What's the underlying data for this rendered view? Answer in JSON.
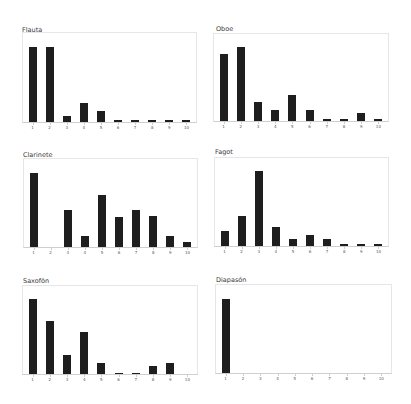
{
  "chart_data": [
    {
      "type": "bar",
      "title": "Flauta",
      "categories": [
        "1",
        "2",
        "3",
        "4",
        "5",
        "6",
        "7",
        "8",
        "9",
        "10"
      ],
      "values": [
        75,
        75,
        6,
        19,
        11,
        2,
        2,
        2,
        2,
        2
      ],
      "xlabel": "",
      "ylabel": "",
      "grid": false,
      "legend": "none",
      "layout": {
        "title_x": 22,
        "title_y": 26,
        "x": 22,
        "y": 32,
        "w": 175,
        "h": 91
      }
    },
    {
      "type": "bar",
      "title": "Oboe",
      "categories": [
        "1",
        "2",
        "3",
        "4",
        "5",
        "6",
        "7",
        "8",
        "9",
        "10"
      ],
      "values": [
        67,
        74,
        19,
        11,
        26,
        11,
        2,
        2,
        8,
        2
      ],
      "xlabel": "",
      "ylabel": "",
      "grid": false,
      "legend": "none",
      "layout": {
        "title_x": 216,
        "title_y": 25,
        "x": 213,
        "y": 33,
        "w": 176,
        "h": 89
      }
    },
    {
      "type": "bar",
      "title": "Clarinete",
      "categories": [
        "1",
        "2",
        "3",
        "4",
        "5",
        "6",
        "7",
        "8",
        "9",
        "10"
      ],
      "values": [
        74,
        0,
        37,
        11,
        52,
        30,
        37,
        31,
        11,
        5
      ],
      "xlabel": "",
      "ylabel": "",
      "grid": false,
      "legend": "none",
      "layout": {
        "title_x": 23,
        "title_y": 151,
        "x": 23,
        "y": 158,
        "w": 175,
        "h": 90
      }
    },
    {
      "type": "bar",
      "title": "Fagot",
      "categories": [
        "1",
        "2",
        "3",
        "4",
        "5",
        "6",
        "7",
        "8",
        "9",
        "10"
      ],
      "values": [
        15,
        30,
        75,
        19,
        7,
        11,
        7,
        2,
        2,
        2
      ],
      "xlabel": "",
      "ylabel": "",
      "grid": false,
      "legend": "none",
      "layout": {
        "title_x": 215,
        "title_y": 148,
        "x": 214,
        "y": 157,
        "w": 175,
        "h": 90
      }
    },
    {
      "type": "bar",
      "title": "Saxofón",
      "categories": [
        "1",
        "2",
        "3",
        "4",
        "5",
        "6",
        "7",
        "8",
        "9",
        "10"
      ],
      "values": [
        75,
        53,
        19,
        42,
        11,
        1,
        1,
        8,
        11,
        0
      ],
      "xlabel": "",
      "ylabel": "",
      "grid": false,
      "legend": "none",
      "layout": {
        "title_x": 23,
        "title_y": 277,
        "x": 22,
        "y": 285,
        "w": 176,
        "h": 90
      }
    },
    {
      "type": "bar",
      "title": "Diapasón",
      "categories": [
        "1",
        "2",
        "3",
        "4",
        "5",
        "6",
        "7",
        "8",
        "9",
        "10"
      ],
      "values": [
        74,
        0,
        0,
        0,
        0,
        0,
        0,
        0,
        0,
        0
      ],
      "xlabel": "",
      "ylabel": "",
      "grid": false,
      "legend": "none",
      "layout": {
        "title_x": 216,
        "title_y": 276,
        "x": 215,
        "y": 284,
        "w": 177,
        "h": 90
      }
    }
  ],
  "colors": {
    "bar": "#1e1e1e",
    "frame": "#e6e6e6",
    "baseline": "#cfcfcf",
    "text": "#3a3a3a"
  }
}
